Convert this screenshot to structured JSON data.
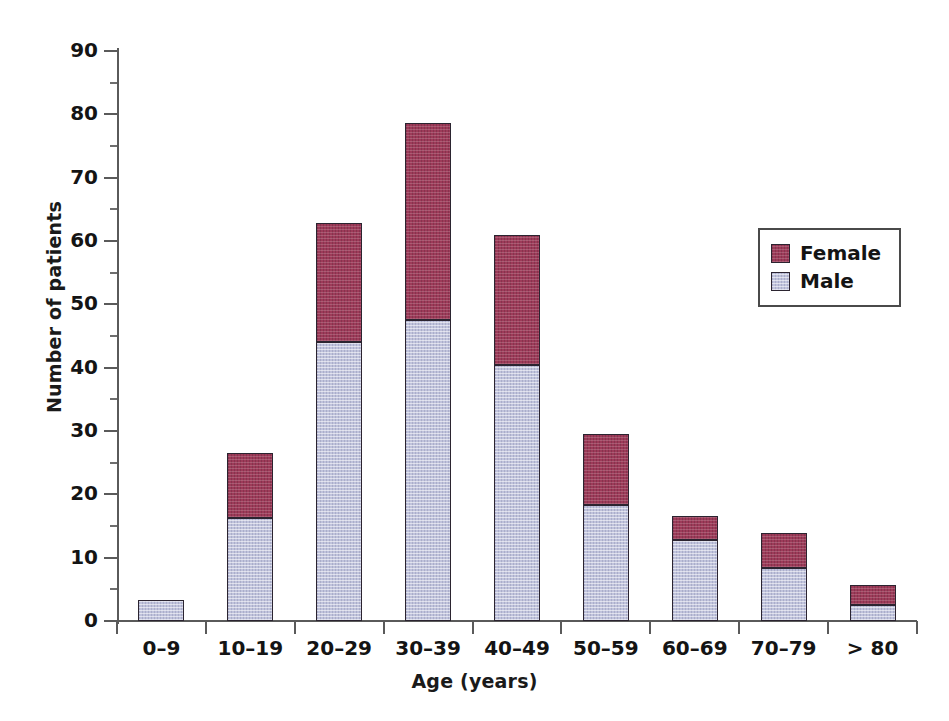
{
  "chart_data": {
    "type": "bar",
    "stacked": true,
    "title": "",
    "xlabel": "Age (years)",
    "ylabel": "Number of patients",
    "categories": [
      "0–9",
      "10–19",
      "20–29",
      "30–39",
      "40–49",
      "50–59",
      "60–69",
      "70–79",
      "> 80"
    ],
    "series": [
      {
        "name": "Male",
        "color": "#c0c3dc",
        "values": [
          3.3,
          16.3,
          44.1,
          47.5,
          40.4,
          18.3,
          12.8,
          8.4,
          2.5
        ]
      },
      {
        "name": "Female",
        "color": "#9d3b59",
        "values": [
          0,
          10.2,
          18.7,
          31.1,
          20.6,
          11.2,
          3.8,
          5.5,
          3.2
        ]
      }
    ],
    "totals": [
      3.3,
      26.5,
      62.8,
      78.6,
      61.0,
      29.5,
      16.6,
      13.9,
      5.7
    ],
    "ylim": [
      0,
      90
    ],
    "ytick_values": [
      0,
      10,
      20,
      30,
      40,
      50,
      60,
      70,
      80,
      90
    ],
    "ytick_labels": [
      "0",
      "10",
      "20",
      "30",
      "40",
      "50",
      "60",
      "70",
      "80",
      "90"
    ],
    "yminor_values": [
      5,
      15,
      25,
      35,
      45,
      55,
      65,
      75,
      85
    ],
    "grid": false,
    "legend_position": "right"
  },
  "legend": {
    "entries": [
      {
        "label": "Female",
        "color": "#9d3b59"
      },
      {
        "label": "Male",
        "color": "#c0c3dc"
      }
    ]
  }
}
